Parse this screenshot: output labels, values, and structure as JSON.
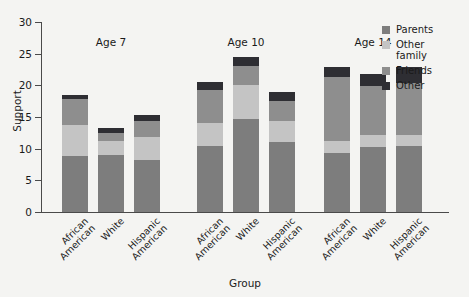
{
  "chart_data": {
    "type": "bar",
    "title": "",
    "xlabel": "Group",
    "ylabel": "Support",
    "ylim": [
      0,
      30
    ],
    "yticks": [
      0,
      5,
      10,
      15,
      20,
      25,
      30
    ],
    "grid": false,
    "legend_position": "top-right",
    "stacked": true,
    "categories": [
      "African American",
      "White",
      "Hispanic American",
      "African American",
      "White",
      "Hispanic American",
      "African American",
      "White",
      "Hispanic American"
    ],
    "groups": [
      {
        "label": "Age 7",
        "categories": [
          "African American",
          "White",
          "Hispanic American"
        ]
      },
      {
        "label": "Age 10",
        "categories": [
          "African American",
          "White",
          "Hispanic American"
        ]
      },
      {
        "label": "Age 14",
        "categories": [
          "African American",
          "White",
          "Hispanic American"
        ]
      }
    ],
    "series": [
      {
        "name": "Parents",
        "color": "#7d7d7d",
        "values": [
          8.8,
          9.0,
          8.2,
          10.5,
          14.7,
          11.1,
          9.3,
          10.2,
          10.5
        ]
      },
      {
        "name": "Other family",
        "color": "#c4c4c4",
        "values": [
          4.9,
          2.2,
          3.7,
          3.6,
          5.4,
          3.3,
          1.9,
          1.9,
          1.6
        ]
      },
      {
        "name": "Friends",
        "color": "#8e8e8e",
        "values": [
          4.1,
          1.3,
          2.5,
          5.1,
          2.9,
          3.2,
          10.1,
          7.8,
          8.3
        ]
      },
      {
        "name": "Other",
        "color": "#2e2e33",
        "values": [
          0.7,
          0.8,
          0.9,
          1.3,
          1.5,
          1.4,
          1.6,
          1.9,
          2.5
        ]
      }
    ],
    "totals": [
      18.5,
      13.3,
      15.3,
      20.5,
      24.5,
      19.0,
      22.9,
      21.8,
      22.9
    ],
    "legend": [
      {
        "label": "Parents",
        "color": "#7d7d7d"
      },
      {
        "label": "Other\nfamily",
        "color": "#c4c4c4"
      },
      {
        "label": "Friends",
        "color": "#8e8e8e"
      },
      {
        "label": "Other",
        "color": "#2e2e33"
      }
    ]
  },
  "colors": {
    "background": "#f4f4f2",
    "axis": "#4a4a4a",
    "text": "#1a1a1a"
  }
}
